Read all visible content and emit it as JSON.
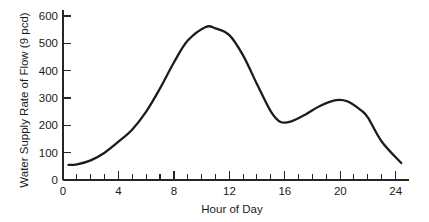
{
  "chart_data": {
    "type": "line",
    "title": "",
    "xlabel": "Hour of Day",
    "ylabel": "Water Supply Rate of Flow (9 pcd)",
    "xlim": [
      0,
      25
    ],
    "ylim": [
      0,
      620
    ],
    "grid": false,
    "legend": null,
    "x_major_ticks": [
      0,
      4,
      8,
      12,
      16,
      20,
      24
    ],
    "x_major_tick_labels": [
      "0",
      "4",
      "8",
      "12",
      "16",
      "20",
      "24"
    ],
    "x_minor_tick_interval": 1,
    "y_major_ticks": [
      0,
      100,
      200,
      300,
      400,
      500,
      600
    ],
    "y_major_tick_labels": [
      "0",
      "100",
      "200",
      "300",
      "400",
      "500",
      "600"
    ],
    "series": [
      {
        "name": "Water supply rate of flow",
        "color": "#1c1c1c",
        "x": [
          0.4,
          1.0,
          2.0,
          3.0,
          4.0,
          5.0,
          6.0,
          7.0,
          8.0,
          9.0,
          10.3,
          11.0,
          12.0,
          13.0,
          14.0,
          15.0,
          15.7,
          16.5,
          17.5,
          18.5,
          19.7,
          20.5,
          21.5,
          22.0,
          23.0,
          24.4
        ],
        "y": [
          55,
          57,
          72,
          100,
          140,
          185,
          250,
          335,
          430,
          510,
          560,
          555,
          530,
          455,
          350,
          250,
          212,
          215,
          240,
          270,
          292,
          288,
          255,
          228,
          140,
          62
        ]
      }
    ],
    "annotations": []
  },
  "axis_labels": {
    "y_axis_title": "Water Supply Rate of Flow (9 pcd)",
    "x_axis_title": "Hour of Day"
  }
}
